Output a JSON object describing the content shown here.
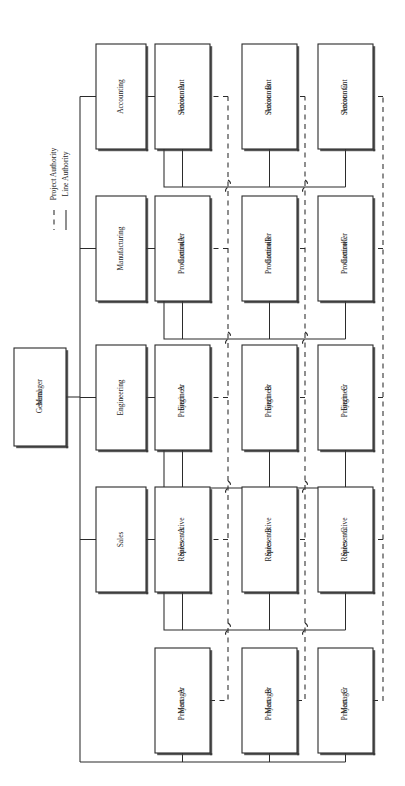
{
  "chart_data": {
    "type": "diagram",
    "diagram_type": "matrix-organization-chart",
    "title": "",
    "orientation": "rotated-90-ccw",
    "legend": {
      "position": "upper-left",
      "entries": [
        {
          "label": "Line Authority",
          "style": "solid"
        },
        {
          "label": "Project Authority",
          "style": "dashed"
        }
      ]
    },
    "nodes": {
      "top": {
        "id": "gm",
        "label": "General Manager",
        "lines": [
          "General",
          "Manager"
        ]
      },
      "functions": [
        {
          "id": "accounting",
          "label": "Accounting",
          "lines": [
            "Accounting"
          ]
        },
        {
          "id": "manufacturing",
          "label": "Manufacturing",
          "lines": [
            "Manufacturing"
          ]
        },
        {
          "id": "engineering",
          "label": "Engineering",
          "lines": [
            "Engineering"
          ]
        },
        {
          "id": "sales",
          "label": "Sales",
          "lines": [
            "Sales"
          ]
        }
      ],
      "projects": [
        {
          "id": "pm-a",
          "label": "Project Manager A",
          "lines": [
            "Project",
            "Manager",
            "A"
          ]
        },
        {
          "id": "pm-b",
          "label": "Project Manager B",
          "lines": [
            "Project",
            "Manager",
            "B"
          ]
        },
        {
          "id": "pm-c",
          "label": "Project Manager C",
          "lines": [
            "Project",
            "Manager",
            "C"
          ]
        }
      ],
      "grid": [
        [
          {
            "id": "sa-a",
            "label": "Senior Accountant A",
            "lines": [
              "Senior",
              "Accountant",
              "A"
            ]
          },
          {
            "id": "sa-b",
            "label": "Senior Accountant B",
            "lines": [
              "Senior",
              "Accountant",
              "B"
            ]
          },
          {
            "id": "sa-c",
            "label": "Senior Accountant C",
            "lines": [
              "Senior",
              "Accountant",
              "C"
            ]
          }
        ],
        [
          {
            "id": "pc-a",
            "label": "Production Controller A",
            "lines": [
              "Production",
              "Controller",
              "A"
            ]
          },
          {
            "id": "pc-b",
            "label": "Production Controller B",
            "lines": [
              "Production",
              "Controller",
              "B"
            ]
          },
          {
            "id": "pc-c",
            "label": "Production Controller C",
            "lines": [
              "Production",
              "Controller",
              "C"
            ]
          }
        ],
        [
          {
            "id": "pe-a",
            "label": "Project Engineer A",
            "lines": [
              "Project",
              "Engineer",
              "A"
            ]
          },
          {
            "id": "pe-b",
            "label": "Project Engineer B",
            "lines": [
              "Project",
              "Engineer",
              "B"
            ]
          },
          {
            "id": "pe-c",
            "label": "Project Engineer C",
            "lines": [
              "Project",
              "Engineer",
              "C"
            ]
          }
        ],
        [
          {
            "id": "sr-a",
            "label": "Sales Representative A",
            "lines": [
              "Sales",
              "Representative",
              "A"
            ]
          },
          {
            "id": "sr-b",
            "label": "Sales Representative B",
            "lines": [
              "Sales",
              "Representative",
              "B"
            ]
          },
          {
            "id": "sr-c",
            "label": "Sales Representative C",
            "lines": [
              "Sales",
              "Representative",
              "C"
            ]
          }
        ]
      ]
    },
    "edges": {
      "line_authority": [
        "gm -> accounting",
        "gm -> manufacturing",
        "gm -> engineering",
        "gm -> sales",
        "gm -> project-bus",
        "accounting -> sa-a",
        "accounting -> sa-b",
        "accounting -> sa-c",
        "manufacturing -> pc-a",
        "manufacturing -> pc-b",
        "manufacturing -> pc-c",
        "engineering -> pe-a",
        "engineering -> pe-b",
        "engineering -> pe-c",
        "sales -> sr-a",
        "sales -> sr-b",
        "sales -> sr-c",
        "project-bus -> pm-a",
        "project-bus -> pm-b",
        "project-bus -> pm-c"
      ],
      "project_authority": [
        "pm-a -> sr-a",
        "pm-a -> pe-a",
        "pm-a -> pc-a",
        "pm-a -> sa-a",
        "pm-b -> sr-b",
        "pm-b -> pe-b",
        "pm-b -> pc-b",
        "pm-b -> sa-b",
        "pm-c -> sr-c",
        "pm-c -> pe-c",
        "pm-c -> pc-c",
        "pm-c -> sa-c"
      ]
    },
    "colors": {
      "stroke": "#2b2b2b",
      "box_fill": "#ffffff",
      "text": "#1d1d1d",
      "background": "#ffffff"
    }
  }
}
